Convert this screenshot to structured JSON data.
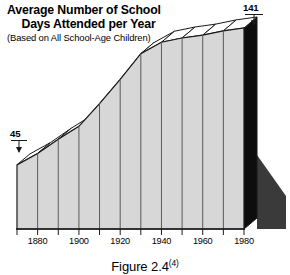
{
  "title": {
    "line1": "Average Number of School",
    "line2": "Days Attended per Year",
    "subtitle": "(Based on All School-Age Children)"
  },
  "callouts": {
    "start_value": "45",
    "end_value": "141"
  },
  "caption": {
    "text": "Figure 2.4",
    "superscript": "(4)"
  },
  "colors": {
    "face": "#d7d7d7",
    "top": "#ffffff",
    "side": "#0d0d0d",
    "shadow": "#3a3a3a",
    "outline": "#1a1a1a",
    "divider": "#5a5a5a",
    "background": "#ffffff"
  },
  "chart_data": {
    "type": "area",
    "title": "Average Number of School Days Attended per Year",
    "subtitle": "(Based on All School-Age Children)",
    "xlabel": "",
    "ylabel": "Days attended per year",
    "x": [
      1870,
      1880,
      1890,
      1900,
      1910,
      1920,
      1930,
      1940,
      1950,
      1960,
      1970,
      1980
    ],
    "values": [
      45,
      53,
      63,
      72,
      88,
      105,
      123,
      131,
      134,
      136,
      139,
      141
    ],
    "tick_labels": [
      "1880",
      "1900",
      "1920",
      "1940",
      "1960",
      "1980"
    ],
    "tick_years": [
      1880,
      1900,
      1920,
      1940,
      1960,
      1980
    ],
    "minor_tick_years": [
      1870,
      1890,
      1910,
      1930,
      1950,
      1970
    ],
    "xlim": [
      1870,
      1980
    ],
    "ylim": [
      0,
      150
    ],
    "grid": false,
    "legend": false,
    "annotations": [
      {
        "label": "45",
        "x": 1870,
        "y": 45
      },
      {
        "label": "141",
        "x": 1980,
        "y": 141
      }
    ],
    "style": "3d-extruded-area"
  }
}
